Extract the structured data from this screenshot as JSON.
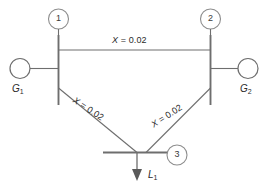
{
  "diagram": {
    "type": "one-line-diagram",
    "colors": {
      "line": "#6e6e6e",
      "text": "#2b2b2b",
      "node_outline": "#8d8d8d",
      "background": "#ffffff",
      "arrow_fill": "#5a5a5a"
    },
    "buses": [
      {
        "id": "1",
        "label": "1",
        "position": "top-left"
      },
      {
        "id": "2",
        "label": "2",
        "position": "top-right"
      },
      {
        "id": "3",
        "label": "3",
        "position": "bottom-center"
      }
    ],
    "generators": [
      {
        "id": "G1",
        "label": "G",
        "sub": "1",
        "bus": "1"
      },
      {
        "id": "G2",
        "label": "G",
        "sub": "2",
        "bus": "2"
      }
    ],
    "loads": [
      {
        "id": "L1",
        "label": "L",
        "sub": "1",
        "bus": "3"
      }
    ],
    "branches": [
      {
        "id": "line-1-2",
        "from": "1",
        "to": "2",
        "variable": "X",
        "equals": "=",
        "value": "0.02",
        "text": "X = 0.02",
        "orientation": "horizontal"
      },
      {
        "id": "line-1-3",
        "from": "1",
        "to": "3",
        "variable": "X",
        "equals": "=",
        "value": "0.02",
        "text": "X = 0.02",
        "orientation": "diagonal-down-right"
      },
      {
        "id": "line-2-3",
        "from": "2",
        "to": "3",
        "variable": "X",
        "equals": "=",
        "value": "0.02",
        "text": "X = 0.02",
        "orientation": "diagonal-down-left"
      }
    ]
  }
}
